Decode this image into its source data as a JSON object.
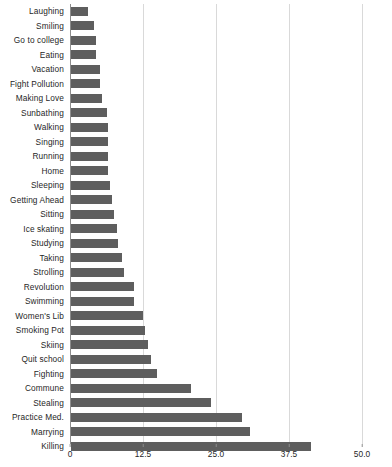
{
  "chart_data": {
    "type": "bar",
    "orientation": "horizontal",
    "title": "",
    "xlabel": "",
    "ylabel": "",
    "xlim": [
      0,
      50
    ],
    "grid": true,
    "legend": false,
    "bar_color": "#5e5e5e",
    "xticks": [
      "0",
      "12.5",
      "25.0",
      "37.5",
      "50.0"
    ],
    "xtick_values": [
      0,
      12.5,
      25.0,
      37.5,
      50.0
    ],
    "categories": [
      "Laughing",
      "Smiling",
      "Go to college",
      "Eating",
      "Vacation",
      "Fight Pollution",
      "Making Love",
      "Sunbathing",
      "Walking",
      "Singing",
      "Running",
      "Home",
      "Sleeping",
      "Getting Ahead",
      "Sitting",
      "Ice skating",
      "Studying",
      "Taking",
      "Strolling",
      "Revolution",
      "Swimming",
      "Women's Lib",
      "Smoking Pot",
      "Skiing",
      "Quit school",
      "Fighting",
      "Commune",
      "Stealing",
      "Practice Med.",
      "Marrying",
      "Killing"
    ],
    "values": [
      2.9,
      3.9,
      4.3,
      4.3,
      5.0,
      4.9,
      5.3,
      6.2,
      6.3,
      6.3,
      6.3,
      6.4,
      6.7,
      7.0,
      7.3,
      7.9,
      8.0,
      8.8,
      9.1,
      10.8,
      10.8,
      12.3,
      12.6,
      13.2,
      13.7,
      14.8,
      20.5,
      24.0,
      29.3,
      30.7,
      41.1
    ]
  }
}
